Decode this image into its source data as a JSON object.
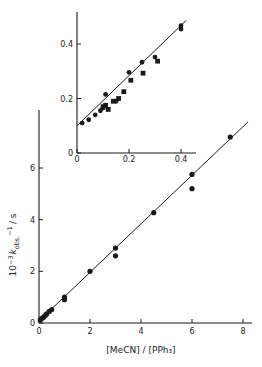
{
  "chart_data": [
    {
      "id": "main",
      "type": "scatter",
      "title": "",
      "xlabel": "[MeCN] / [PPh3]",
      "ylabel": "10^-3 k_obs.^-1 / s",
      "xlim": [
        0,
        8.3
      ],
      "ylim": [
        0,
        7.5
      ],
      "xticks": [
        0,
        2,
        4,
        6,
        8
      ],
      "yticks": [
        0,
        2,
        4,
        6
      ],
      "grid": false,
      "legend": null,
      "fit_line": {
        "slope": 0.94,
        "intercept": 0.08,
        "x_range": [
          0,
          8.2
        ]
      },
      "series": [
        {
          "name": "circles",
          "marker": "circle",
          "points": [
            [
              0.05,
              0.12
            ],
            [
              0.1,
              0.17
            ],
            [
              0.15,
              0.2
            ],
            [
              0.2,
              0.25
            ],
            [
              0.25,
              0.3
            ],
            [
              0.3,
              0.35
            ],
            [
              0.4,
              0.45
            ],
            [
              0.5,
              0.52
            ],
            [
              1.0,
              1.0
            ],
            [
              1.0,
              0.9
            ],
            [
              2.0,
              2.0
            ],
            [
              3.0,
              2.9
            ],
            [
              3.0,
              2.6
            ],
            [
              4.5,
              4.27
            ],
            [
              6.0,
              5.75
            ],
            [
              6.0,
              5.2
            ],
            [
              7.5,
              7.2
            ]
          ]
        }
      ]
    },
    {
      "id": "inset",
      "type": "scatter",
      "title": "",
      "xlabel": "",
      "ylabel": "",
      "xlim": [
        0,
        0.42
      ],
      "ylim": [
        0,
        0.52
      ],
      "xticks": [
        0,
        0.2,
        0.4
      ],
      "yticks": [
        0,
        0.2,
        0.4
      ],
      "grid": false,
      "legend": null,
      "fit_line": {
        "slope": 0.92,
        "intercept": 0.1,
        "x_range": [
          0,
          0.42
        ]
      },
      "series": [
        {
          "name": "circles",
          "marker": "circle",
          "points": [
            [
              0.02,
              0.11
            ],
            [
              0.045,
              0.122
            ],
            [
              0.07,
              0.14
            ],
            [
              0.09,
              0.155
            ],
            [
              0.1,
              0.165
            ],
            [
              0.11,
              0.215
            ],
            [
              0.15,
              0.19
            ],
            [
              0.2,
              0.296
            ],
            [
              0.25,
              0.333
            ],
            [
              0.3,
              0.352
            ],
            [
              0.4,
              0.467
            ],
            [
              0.4,
              0.455
            ]
          ]
        },
        {
          "name": "squares",
          "marker": "square",
          "points": [
            [
              0.1,
              0.17
            ],
            [
              0.11,
              0.175
            ],
            [
              0.12,
              0.16
            ],
            [
              0.14,
              0.19
            ],
            [
              0.16,
              0.2
            ],
            [
              0.18,
              0.225
            ],
            [
              0.207,
              0.267
            ],
            [
              0.254,
              0.293
            ],
            [
              0.31,
              0.337
            ]
          ]
        }
      ]
    }
  ],
  "labels": {
    "main_xlabel": "[MeCN] / [PPh₃]",
    "main_ylabel_prefix": "10",
    "main_ylabel_exp": "−3",
    "main_ylabel_k": "k",
    "main_ylabel_sub": "obs.",
    "main_ylabel_sup": "−1",
    "main_ylabel_suffix": "/ s"
  }
}
